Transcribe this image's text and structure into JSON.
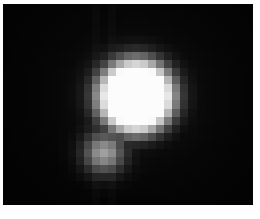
{
  "image": {
    "description": "Pixelated grayscale image of a bright circular blob with a fainter companion blob below-left, on black background with thin white border",
    "background": "#030303",
    "border": "#ffffff",
    "grid": {
      "cols": 31,
      "rows": 25,
      "cell_px": 8.06,
      "primary_blob": {
        "center_col": 16,
        "center_row": 11,
        "radius_cells": 5.2,
        "peak": 250
      },
      "secondary_blob": {
        "center_col": 12,
        "center_row": 18,
        "radius_cells": 2.4,
        "peak": 150
      }
    }
  }
}
